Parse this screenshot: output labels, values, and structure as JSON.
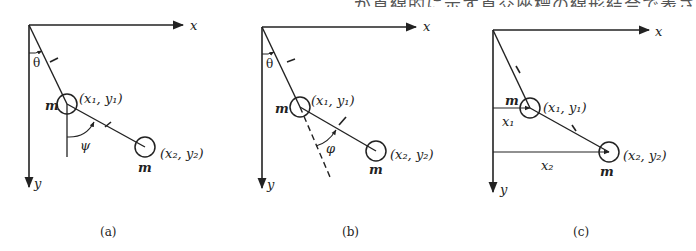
{
  "header_text_clipped": "…が直線的に示す直交座標の線形結合で表さ",
  "panels": [
    {
      "id": "a",
      "caption": "(a)",
      "axis_x_label": "x",
      "axis_y_label": "y",
      "angle1_label": "θ",
      "angle2_label": "ψ",
      "rod1_label": "l",
      "rod2_label": "l",
      "mass1_label": "m",
      "mass2_label": "m",
      "point1_label": "(x₁, y₁)",
      "point2_label": "(x₂, y₂)"
    },
    {
      "id": "b",
      "caption": "(b)",
      "axis_x_label": "x",
      "axis_y_label": "y",
      "angle1_label": "θ",
      "angle2_label": "φ",
      "rod1_label": "l",
      "rod2_label": "l",
      "mass1_label": "m",
      "mass2_label": "m",
      "point1_label": "(x₁, y₁)",
      "point2_label": "(x₂, y₂)"
    },
    {
      "id": "c",
      "caption": "(c)",
      "axis_x_label": "x",
      "axis_y_label": "y",
      "rod1_label": "l",
      "rod2_label": "l",
      "mass1_label": "m",
      "mass2_label": "m",
      "point1_label": "(x₁, y₁)",
      "point2_label": "(x₂, y₂)",
      "dist1_label": "x₁",
      "dist2_label": "x₂"
    }
  ],
  "colors": {
    "ink": "#222222",
    "background": "#ffffff"
  }
}
